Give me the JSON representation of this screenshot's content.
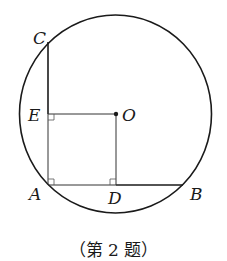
{
  "diagram": {
    "circle": {
      "cx": 115.5,
      "cy": 114,
      "rx": 96,
      "ry": 99,
      "stroke": "#1a1a1a"
    },
    "points": {
      "C": {
        "x": 47,
        "y": 42,
        "label": "C"
      },
      "E": {
        "x": 49,
        "y": 114,
        "label": "E"
      },
      "O": {
        "x": 116,
        "y": 114,
        "label": "O"
      },
      "A": {
        "x": 49,
        "y": 185,
        "label": "A"
      },
      "D": {
        "x": 116,
        "y": 185,
        "label": "D"
      },
      "B": {
        "x": 183,
        "y": 185,
        "label": "B"
      }
    },
    "segments": [
      "CA",
      "AB",
      "EO",
      "OD"
    ],
    "right_angles": [
      "E",
      "A",
      "D"
    ],
    "caption": "（第 2 题）"
  }
}
